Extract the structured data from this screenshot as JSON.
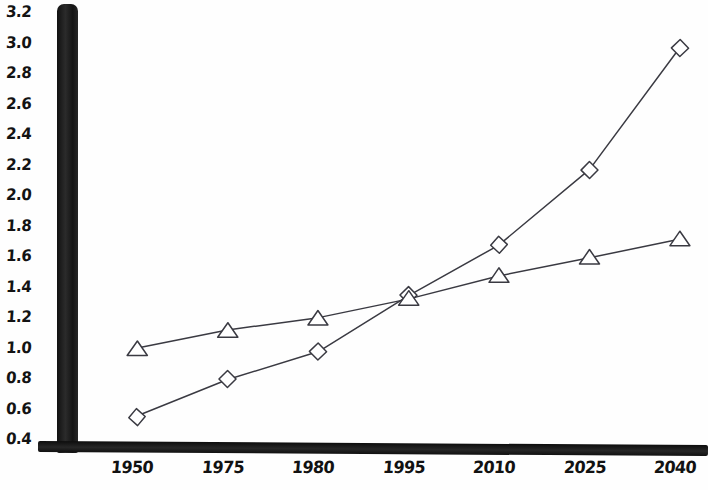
{
  "chart_data": {
    "type": "line",
    "title": "",
    "xlabel": "",
    "ylabel": "",
    "categories": [
      "1950",
      "1975",
      "1980",
      "1995",
      "2010",
      "2025",
      "2040"
    ],
    "ylim": [
      0.4,
      3.2
    ],
    "ytick_labels": [
      "3.2",
      "3.0",
      "2.8",
      "2.6",
      "2.4",
      "2.2",
      "2.0",
      "1.8",
      "1.6",
      "1.4",
      "1.2",
      "1.0",
      "0.8",
      "0.6",
      "0.4"
    ],
    "ytick_values": [
      3.2,
      3.0,
      2.8,
      2.6,
      2.4,
      2.2,
      2.0,
      1.8,
      1.6,
      1.4,
      1.2,
      1.0,
      0.8,
      0.6,
      0.4
    ],
    "grid": false,
    "legend": "none",
    "style": "hand-drawn sketch",
    "line_color": "#3a3a42",
    "axis_color": "#1a1a1a",
    "series": [
      {
        "name": "diamond-series",
        "marker": "diamond",
        "values": [
          0.55,
          0.8,
          0.98,
          1.35,
          1.68,
          2.17,
          2.97
        ]
      },
      {
        "name": "triangle-series",
        "marker": "triangle",
        "values": [
          1.0,
          1.12,
          1.2,
          1.33,
          1.48,
          1.6,
          1.72
        ]
      }
    ]
  }
}
